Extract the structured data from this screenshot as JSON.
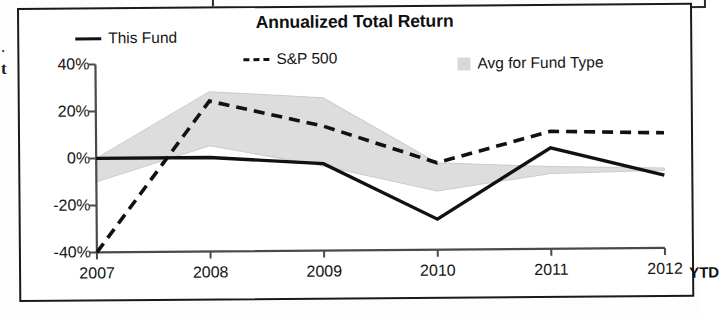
{
  "frame": {
    "edge_fragment_top": ".",
    "edge_fragment_bottom": "t"
  },
  "chart_data": {
    "type": "line",
    "title": "Annualized Total Return",
    "xlabel": "",
    "ylabel": "",
    "categories": [
      "2007",
      "2008",
      "2009",
      "2010",
      "2011",
      "2012"
    ],
    "x_axis_suffix": "YTD",
    "ylim": [
      -40,
      40
    ],
    "y_ticks": [
      40,
      20,
      0,
      -20,
      -40
    ],
    "y_tick_labels": [
      "40%",
      "20%",
      "0%",
      "-20%",
      "-40%"
    ],
    "grid": false,
    "legend_position": "top",
    "series": [
      {
        "name": "This Fund",
        "style": "solid",
        "color": "#111111",
        "values": [
          0,
          0,
          -3,
          -27,
          3,
          -9
        ]
      },
      {
        "name": "S&P 500",
        "style": "dashed",
        "color": "#111111",
        "values": [
          -40,
          24,
          13,
          -3,
          10,
          9
        ]
      },
      {
        "name": "Avg for Fund Type",
        "style": "band",
        "color": "#d8d8d8",
        "upper": [
          0,
          28,
          25,
          -3,
          -5,
          -6
        ],
        "lower": [
          -10,
          5,
          -4,
          -15,
          -8,
          -7
        ]
      }
    ],
    "legend": [
      "This Fund",
      "S&P 500",
      "Avg for Fund Type"
    ]
  }
}
